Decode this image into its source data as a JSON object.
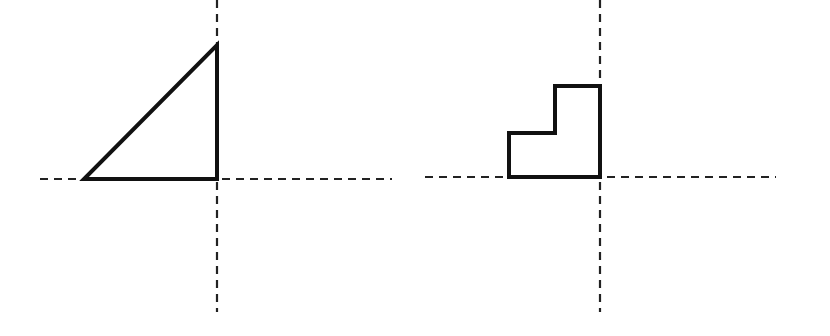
{
  "diagram": {
    "background": "#ffffff",
    "stroke_color": "#111111",
    "axis_color": "#222222",
    "figures": [
      {
        "id": "left",
        "shape": "right-triangle",
        "axes": {
          "vertical": {
            "x": 217,
            "y1": 0,
            "y2": 312
          },
          "horizontal": {
            "y": 179,
            "x1": 40,
            "x2": 392
          }
        },
        "polygon": [
          [
            84,
            179
          ],
          [
            217,
            179
          ],
          [
            217,
            45
          ]
        ]
      },
      {
        "id": "right",
        "shape": "staircase-l-shape",
        "axes": {
          "vertical": {
            "x": 600,
            "y1": 0,
            "y2": 312
          },
          "horizontal": {
            "y": 177,
            "x1": 425,
            "x2": 776
          }
        },
        "polygon": [
          [
            509,
            177
          ],
          [
            600,
            177
          ],
          [
            600,
            86
          ],
          [
            555,
            86
          ],
          [
            555,
            133
          ],
          [
            509,
            133
          ]
        ]
      }
    ]
  }
}
